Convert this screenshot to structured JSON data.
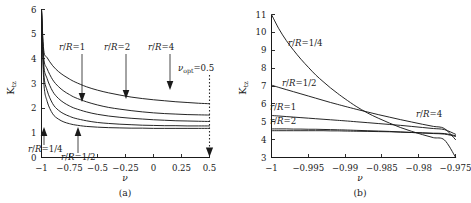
{
  "figure": {
    "panels": [
      {
        "id": "a",
        "caption": "(a)",
        "ylabel": "K",
        "ylabel_sub": "tz",
        "xlabel": "ν",
        "annotation": "ν",
        "annotation_sub": "opt",
        "annotation_value": "=0.5",
        "xticks": [
          "−1",
          "−0.75",
          "−0.5",
          "−0.25",
          "0",
          "0.25",
          "0.5"
        ],
        "xtickvals": [
          -1,
          -0.75,
          -0.5,
          -0.25,
          0,
          0.25,
          0.5
        ],
        "yticks": [
          "0",
          "1",
          "2",
          "3",
          "4",
          "5",
          "6"
        ],
        "ytickvals": [
          0,
          1,
          2,
          3,
          4,
          5,
          6
        ],
        "curve_labels": [
          {
            "text": "r/R=1",
            "x": 83,
            "y": 52
          },
          {
            "text": "r/R=2",
            "x": 128,
            "y": 52
          },
          {
            "text": "r/R=4",
            "x": 172,
            "y": 52
          },
          {
            "text": "r/R=1/4",
            "x": 39,
            "y": 151
          },
          {
            "text": "r/R=1/2",
            "x": 72,
            "y": 159
          }
        ]
      },
      {
        "id": "b",
        "caption": "(b)",
        "ylabel": "K",
        "ylabel_sub": "tz",
        "xlabel": "ν",
        "xticks": [
          "−1",
          "−0.995",
          "−0.99",
          "−0.985",
          "−0.98",
          "−0.975"
        ],
        "xtickvals": [
          -1,
          -0.995,
          -0.99,
          -0.985,
          -0.98,
          -0.975
        ],
        "yticks": [
          "3",
          "4",
          "5",
          "6",
          "7",
          "8",
          "9",
          "10",
          "11"
        ],
        "ytickvals": [
          3,
          4,
          5,
          6,
          7,
          8,
          9,
          10,
          11
        ],
        "curve_labels": [
          {
            "text": "r/R=1/4",
            "x": 297,
            "y": 43
          },
          {
            "text": "r/R=1/2",
            "x": 291,
            "y": 84
          },
          {
            "text": "r/R=1",
            "x": 266,
            "y": 108
          },
          {
            "text": "r/R=2",
            "x": 266,
            "y": 122
          },
          {
            "text": "r/R=4",
            "x": 416,
            "y": 114
          }
        ]
      }
    ]
  },
  "chart_data": [
    {
      "type": "line",
      "panel": "(a)",
      "title": "",
      "xlabel": "ν",
      "ylabel": "K_tz",
      "xlim": [
        -1,
        0.5
      ],
      "ylim": [
        0,
        6
      ],
      "grid": false,
      "legend": "inline-annotations",
      "annotations": [
        {
          "text": "ν_opt=0.5",
          "x": 0.5,
          "type": "dotted-vline-with-down-arrow"
        }
      ],
      "x": [
        -1,
        -0.98,
        -0.95,
        -0.9,
        -0.85,
        -0.8,
        -0.75,
        -0.7,
        -0.6,
        -0.5,
        -0.4,
        -0.3,
        -0.2,
        -0.1,
        0,
        0.1,
        0.2,
        0.3,
        0.4,
        0.5
      ],
      "series": [
        {
          "name": "r/R=4",
          "values": [
            6.0,
            4.35,
            4.05,
            3.72,
            3.49,
            3.32,
            3.18,
            3.06,
            2.87,
            2.73,
            2.62,
            2.53,
            2.45,
            2.39,
            2.34,
            2.3,
            2.26,
            2.23,
            2.2,
            2.18
          ]
        },
        {
          "name": "r/R=2",
          "values": [
            6.0,
            4.05,
            3.6,
            3.15,
            2.88,
            2.69,
            2.55,
            2.43,
            2.26,
            2.13,
            2.03,
            1.96,
            1.9,
            1.85,
            1.81,
            1.78,
            1.76,
            1.74,
            1.73,
            1.72
          ]
        },
        {
          "name": "r/R=1",
          "values": [
            6.0,
            3.78,
            3.2,
            2.68,
            2.4,
            2.22,
            2.09,
            1.99,
            1.85,
            1.75,
            1.68,
            1.63,
            1.59,
            1.56,
            1.53,
            1.51,
            1.49,
            1.48,
            1.47,
            1.46
          ]
        },
        {
          "name": "r/R=1/2",
          "values": [
            6.0,
            3.45,
            2.72,
            2.18,
            1.92,
            1.77,
            1.67,
            1.59,
            1.49,
            1.42,
            1.38,
            1.35,
            1.33,
            1.31,
            1.3,
            1.29,
            1.29,
            1.28,
            1.28,
            1.28
          ]
        },
        {
          "name": "r/R=1/4",
          "values": [
            6.0,
            3.1,
            2.28,
            1.77,
            1.56,
            1.44,
            1.37,
            1.32,
            1.26,
            1.23,
            1.21,
            1.2,
            1.19,
            1.19,
            1.18,
            1.18,
            1.18,
            1.18,
            1.18,
            1.18
          ]
        }
      ]
    },
    {
      "type": "line",
      "panel": "(b)",
      "title": "",
      "xlabel": "ν",
      "ylabel": "K_tz",
      "xlim": [
        -1,
        -0.975
      ],
      "ylim": [
        3,
        11
      ],
      "grid": false,
      "legend": "inline-annotations",
      "x": [
        -1,
        -0.999,
        -0.998,
        -0.997,
        -0.996,
        -0.995,
        -0.994,
        -0.993,
        -0.992,
        -0.991,
        -0.99,
        -0.9885,
        -0.987,
        -0.9855,
        -0.984,
        -0.9825,
        -0.981,
        -0.9795,
        -0.978,
        -0.9765,
        -0.975
      ],
      "series": [
        {
          "name": "r/R=1/4",
          "values": [
            11.0,
            10.2,
            9.55,
            9.0,
            8.5,
            8.05,
            7.62,
            7.25,
            6.9,
            6.58,
            6.28,
            5.86,
            5.5,
            5.2,
            4.93,
            4.68,
            4.47,
            4.28,
            4.11,
            3.98,
            3.02
          ]
        },
        {
          "name": "r/R=1/2",
          "values": [
            7.05,
            6.92,
            6.8,
            6.68,
            6.56,
            6.44,
            6.32,
            6.2,
            6.08,
            5.97,
            5.86,
            5.7,
            5.55,
            5.4,
            5.26,
            5.12,
            4.99,
            4.86,
            4.74,
            4.62,
            4.0
          ]
        },
        {
          "name": "r/R=1",
          "values": [
            5.35,
            5.32,
            5.29,
            5.26,
            5.23,
            5.2,
            5.17,
            5.14,
            5.11,
            5.08,
            5.05,
            5.0,
            4.95,
            4.9,
            4.85,
            4.8,
            4.74,
            4.68,
            4.62,
            4.56,
            4.3
          ]
        },
        {
          "name": "r/R=2",
          "values": [
            4.6,
            4.6,
            4.6,
            4.59,
            4.59,
            4.58,
            4.58,
            4.57,
            4.56,
            4.55,
            4.54,
            4.52,
            4.5,
            4.48,
            4.46,
            4.43,
            4.4,
            4.37,
            4.34,
            4.31,
            4.18
          ]
        },
        {
          "name": "r/R=4",
          "values": [
            4.5,
            4.5,
            4.5,
            4.5,
            4.5,
            4.5,
            4.5,
            4.5,
            4.49,
            4.49,
            4.48,
            4.47,
            4.46,
            4.45,
            4.44,
            4.42,
            4.4,
            4.38,
            4.36,
            4.34,
            4.22
          ]
        }
      ]
    }
  ]
}
